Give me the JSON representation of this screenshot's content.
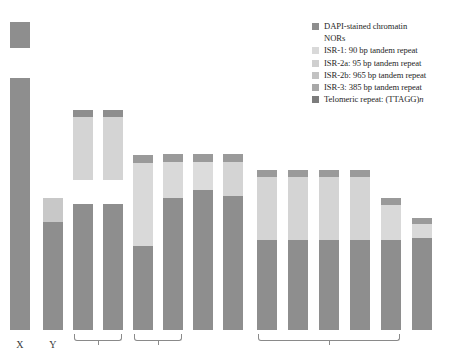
{
  "figure": {
    "title": "",
    "width": 467,
    "height": 359
  },
  "colors": {
    "dapi_stained_chromatin": "#8e8e8e",
    "nors": "#ffffff",
    "isr_1": "#d9d9d9",
    "isr_2a": "#cfcfcf",
    "isr_2b": "#c2c2c2",
    "isr_3": "#a8a8a8",
    "telomeric_repeat": "#7c7c7c",
    "bracket": "#8a8a8a",
    "label_text": "#3a3a3a",
    "legend_text": "#262626",
    "background": "#ffffff"
  },
  "legend": {
    "position": "top-right",
    "items": [
      {
        "label": "DAPI-stained chromatin",
        "swatch": "#8e8e8e",
        "has_swatch": true,
        "italic_suffix": ""
      },
      {
        "label": "NORs",
        "swatch": "#ffffff",
        "has_swatch": false,
        "italic_suffix": ""
      },
      {
        "label": "ISR-1: 90 bp tandem repeat",
        "swatch": "#d9d9d9",
        "has_swatch": true,
        "italic_suffix": ""
      },
      {
        "label": "ISR-2a: 95 bp tandem repeat",
        "swatch": "#cfcfcf",
        "has_swatch": true,
        "italic_suffix": ""
      },
      {
        "label": "ISR-2b: 965 bp tandem repeat",
        "swatch": "#c2c2c2",
        "has_swatch": true,
        "italic_suffix": ""
      },
      {
        "label": "ISR-3: 385 bp tandem repeat",
        "swatch": "#a8a8a8",
        "has_swatch": true,
        "italic_suffix": ""
      },
      {
        "label": "Telomeric repeat: (TTAGG)",
        "swatch": "#7c7c7c",
        "has_swatch": true,
        "italic_suffix": "n"
      }
    ]
  },
  "chart_data": {
    "type": "bar",
    "title": "",
    "xlabel": "",
    "ylabel": "",
    "grid": false,
    "legend_position": "top-right",
    "baseline_y": 330,
    "categories": [
      "X",
      "Y",
      "3",
      "4",
      "5",
      "6",
      "7",
      "8",
      "9",
      "10",
      "11",
      "12",
      "13",
      "14"
    ],
    "bar_width": 20,
    "bars": [
      {
        "name": "X",
        "x": 10,
        "total_height": 308,
        "segments": [
          {
            "fill": "#8e8e8e",
            "from_top": 0,
            "length": 26,
            "detached": true,
            "name": "isr-block"
          },
          {
            "fill": "#ffffff",
            "from_top": 26,
            "length": 30,
            "detached": false,
            "name": "nor-gap"
          },
          {
            "fill": "#8e8e8e",
            "from_top": 56,
            "length": 252,
            "detached": false,
            "name": "dapi-body"
          }
        ]
      },
      {
        "name": "Y",
        "x": 43,
        "total_height": 132,
        "segments": [
          {
            "fill": "#c8c8c8",
            "from_top": 0,
            "length": 24,
            "detached": false,
            "name": "isr-cap"
          },
          {
            "fill": "#8e8e8e",
            "from_top": 24,
            "length": 108,
            "detached": false,
            "name": "dapi-body"
          }
        ]
      },
      {
        "name": "3",
        "x": 73,
        "total_height": 220,
        "segments": [
          {
            "fill": "#8e8e8e",
            "from_top": 0,
            "length": 7,
            "detached": true,
            "name": "telomere-cap"
          },
          {
            "fill": "#d4d4d4",
            "from_top": 7,
            "length": 63,
            "detached": true,
            "name": "isr-block"
          },
          {
            "fill": "#ffffff",
            "from_top": 70,
            "length": 24,
            "detached": false,
            "name": "nor-gap"
          },
          {
            "fill": "#8e8e8e",
            "from_top": 94,
            "length": 126,
            "detached": false,
            "name": "dapi-body"
          }
        ]
      },
      {
        "name": "4",
        "x": 103,
        "total_height": 220,
        "segments": [
          {
            "fill": "#8e8e8e",
            "from_top": 0,
            "length": 7,
            "detached": true,
            "name": "telomere-cap"
          },
          {
            "fill": "#d4d4d4",
            "from_top": 7,
            "length": 63,
            "detached": true,
            "name": "isr-block"
          },
          {
            "fill": "#ffffff",
            "from_top": 70,
            "length": 24,
            "detached": false,
            "name": "nor-gap"
          },
          {
            "fill": "#8e8e8e",
            "from_top": 94,
            "length": 126,
            "detached": false,
            "name": "dapi-body"
          }
        ]
      },
      {
        "name": "5",
        "x": 133,
        "total_height": 175,
        "segments": [
          {
            "fill": "#9a9a9a",
            "from_top": 0,
            "length": 8,
            "detached": false,
            "name": "telomere-cap"
          },
          {
            "fill": "#d9d9d9",
            "from_top": 8,
            "length": 83,
            "detached": false,
            "name": "isr-block"
          },
          {
            "fill": "#8e8e8e",
            "from_top": 91,
            "length": 84,
            "detached": false,
            "name": "dapi-body"
          }
        ]
      },
      {
        "name": "6",
        "x": 163,
        "total_height": 176,
        "segments": [
          {
            "fill": "#9a9a9a",
            "from_top": 0,
            "length": 8,
            "detached": false,
            "name": "telomere-cap"
          },
          {
            "fill": "#d9d9d9",
            "from_top": 8,
            "length": 36,
            "detached": false,
            "name": "isr-block"
          },
          {
            "fill": "#8e8e8e",
            "from_top": 44,
            "length": 132,
            "detached": false,
            "name": "dapi-body"
          }
        ]
      },
      {
        "name": "7",
        "x": 193,
        "total_height": 176,
        "segments": [
          {
            "fill": "#9a9a9a",
            "from_top": 0,
            "length": 8,
            "detached": false,
            "name": "telomere-cap"
          },
          {
            "fill": "#dcdcdc",
            "from_top": 8,
            "length": 28,
            "detached": false,
            "name": "isr-block"
          },
          {
            "fill": "#8e8e8e",
            "from_top": 36,
            "length": 140,
            "detached": false,
            "name": "dapi-body"
          }
        ]
      },
      {
        "name": "8",
        "x": 223,
        "total_height": 176,
        "segments": [
          {
            "fill": "#9a9a9a",
            "from_top": 0,
            "length": 8,
            "detached": false,
            "name": "telomere-cap"
          },
          {
            "fill": "#d4d4d4",
            "from_top": 8,
            "length": 34,
            "detached": false,
            "name": "isr-block"
          },
          {
            "fill": "#8e8e8e",
            "from_top": 42,
            "length": 134,
            "detached": false,
            "name": "dapi-body"
          }
        ]
      },
      {
        "name": "9",
        "x": 257,
        "total_height": 160,
        "segments": [
          {
            "fill": "#9a9a9a",
            "from_top": 0,
            "length": 7,
            "detached": false,
            "name": "telomere-cap"
          },
          {
            "fill": "#d4d4d4",
            "from_top": 7,
            "length": 63,
            "detached": false,
            "name": "isr-block"
          },
          {
            "fill": "#8e8e8e",
            "from_top": 70,
            "length": 90,
            "detached": false,
            "name": "dapi-body"
          }
        ]
      },
      {
        "name": "10",
        "x": 288,
        "total_height": 160,
        "segments": [
          {
            "fill": "#9a9a9a",
            "from_top": 0,
            "length": 7,
            "detached": false,
            "name": "telomere-cap"
          },
          {
            "fill": "#d4d4d4",
            "from_top": 7,
            "length": 63,
            "detached": false,
            "name": "isr-block"
          },
          {
            "fill": "#8e8e8e",
            "from_top": 70,
            "length": 90,
            "detached": false,
            "name": "dapi-body"
          }
        ]
      },
      {
        "name": "11",
        "x": 319,
        "total_height": 160,
        "segments": [
          {
            "fill": "#9a9a9a",
            "from_top": 0,
            "length": 7,
            "detached": false,
            "name": "telomere-cap"
          },
          {
            "fill": "#d4d4d4",
            "from_top": 7,
            "length": 63,
            "detached": false,
            "name": "isr-block"
          },
          {
            "fill": "#8e8e8e",
            "from_top": 70,
            "length": 90,
            "detached": false,
            "name": "dapi-body"
          }
        ]
      },
      {
        "name": "12",
        "x": 350,
        "total_height": 160,
        "segments": [
          {
            "fill": "#9a9a9a",
            "from_top": 0,
            "length": 7,
            "detached": false,
            "name": "telomere-cap"
          },
          {
            "fill": "#d4d4d4",
            "from_top": 7,
            "length": 63,
            "detached": false,
            "name": "isr-block"
          },
          {
            "fill": "#8e8e8e",
            "from_top": 70,
            "length": 90,
            "detached": false,
            "name": "dapi-body"
          }
        ]
      },
      {
        "name": "13",
        "x": 381,
        "total_height": 132,
        "segments": [
          {
            "fill": "#9a9a9a",
            "from_top": 0,
            "length": 7,
            "detached": false,
            "name": "telomere-cap"
          },
          {
            "fill": "#d9d9d9",
            "from_top": 7,
            "length": 35,
            "detached": false,
            "name": "isr-block"
          },
          {
            "fill": "#8e8e8e",
            "from_top": 42,
            "length": 90,
            "detached": false,
            "name": "dapi-body"
          }
        ]
      },
      {
        "name": "14",
        "x": 412,
        "total_height": 112,
        "segments": [
          {
            "fill": "#9a9a9a",
            "from_top": 0,
            "length": 6,
            "detached": false,
            "name": "telomere-cap"
          },
          {
            "fill": "#d9d9d9",
            "from_top": 6,
            "length": 14,
            "detached": false,
            "name": "isr-block"
          },
          {
            "fill": "#8e8e8e",
            "from_top": 20,
            "length": 92,
            "detached": false,
            "name": "dapi-body"
          }
        ]
      }
    ],
    "axis_labels": [
      {
        "text": "X",
        "x": 10,
        "width": 20
      },
      {
        "text": "Y",
        "x": 43,
        "width": 20
      }
    ],
    "brackets": [
      {
        "name": "bracket-pair-3-4",
        "left": 74,
        "width": 48
      },
      {
        "name": "bracket-pair-5-6",
        "left": 134,
        "width": 48
      },
      {
        "name": "bracket-group-9-13",
        "left": 258,
        "width": 142
      }
    ]
  }
}
